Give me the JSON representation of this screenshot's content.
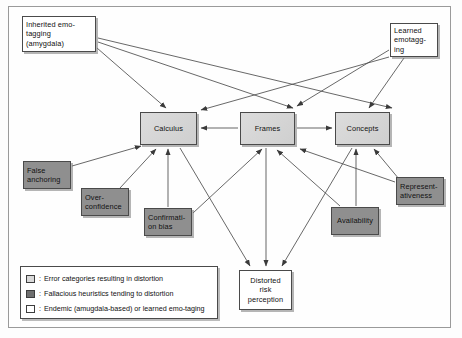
{
  "figure": {
    "colors": {
      "light_gray_fill": "#d6d6d6",
      "dark_gray_fill": "#8f8f8f",
      "white_fill": "#ffffff",
      "border": "#4a4a4a",
      "background": "#fefefe"
    }
  },
  "nodes": [
    {
      "id": "inherited",
      "label": "Inherited emo-\ntagging\n(amygdala)",
      "style": "white",
      "align": "left",
      "x": 22,
      "y": 16,
      "w": 74,
      "h": 36
    },
    {
      "id": "learned",
      "label": "Learned\nemotagg-\ning",
      "style": "white",
      "align": "left",
      "x": 390,
      "y": 23,
      "w": 48,
      "h": 34
    },
    {
      "id": "calculus",
      "label": "Calculus",
      "style": "lightgray",
      "align": "center",
      "x": 140,
      "y": 112,
      "w": 57,
      "h": 33
    },
    {
      "id": "frames",
      "label": "Frames",
      "style": "lightgray",
      "align": "center",
      "x": 240,
      "y": 112,
      "w": 55,
      "h": 33
    },
    {
      "id": "concepts",
      "label": "Concepts",
      "style": "lightgray",
      "align": "center",
      "x": 335,
      "y": 112,
      "w": 55,
      "h": 33
    },
    {
      "id": "false-anchor",
      "label": "False\nanchoring",
      "style": "darkgray",
      "align": "left",
      "x": 23,
      "y": 161,
      "w": 48,
      "h": 28
    },
    {
      "id": "overconfidence",
      "label": "Over-\nconfidence",
      "style": "darkgray",
      "align": "left",
      "x": 81,
      "y": 188,
      "w": 48,
      "h": 28
    },
    {
      "id": "confirmation",
      "label": "Confirmati-\non bias",
      "style": "darkgray",
      "align": "left",
      "x": 144,
      "y": 208,
      "w": 48,
      "h": 28
    },
    {
      "id": "availability",
      "label": "Availability",
      "style": "darkgray",
      "align": "center",
      "x": 331,
      "y": 207,
      "w": 48,
      "h": 28
    },
    {
      "id": "representative",
      "label": "Represent-\nativeness",
      "style": "darkgray",
      "align": "left",
      "x": 396,
      "y": 177,
      "w": 48,
      "h": 28
    },
    {
      "id": "distorted",
      "label": "Distorted\nrisk\nperception",
      "style": "white",
      "align": "center",
      "x": 239,
      "y": 270,
      "w": 53,
      "h": 40
    }
  ],
  "edges": [
    {
      "from": "inherited",
      "to": "calculus"
    },
    {
      "from": "inherited",
      "to": "frames"
    },
    {
      "from": "inherited",
      "to": "concepts"
    },
    {
      "from": "learned",
      "to": "calculus"
    },
    {
      "from": "learned",
      "to": "frames"
    },
    {
      "from": "learned",
      "to": "concepts"
    },
    {
      "from": "frames",
      "to": "calculus"
    },
    {
      "from": "frames",
      "to": "concepts"
    },
    {
      "from": "false-anchor",
      "to": "calculus"
    },
    {
      "from": "overconfidence",
      "to": "calculus"
    },
    {
      "from": "confirmation",
      "to": "calculus"
    },
    {
      "from": "confirmation",
      "to": "frames"
    },
    {
      "from": "availability",
      "to": "frames"
    },
    {
      "from": "availability",
      "to": "concepts"
    },
    {
      "from": "representative",
      "to": "frames"
    },
    {
      "from": "representative",
      "to": "concepts"
    },
    {
      "from": "calculus",
      "to": "distorted"
    },
    {
      "from": "frames",
      "to": "distorted"
    },
    {
      "from": "concepts",
      "to": "distorted"
    }
  ],
  "legend": {
    "rows": [
      {
        "swatch": "lightgray",
        "separator": ":",
        "text": "Error categories resulting in distortion"
      },
      {
        "swatch": "darkgray",
        "separator": ":",
        "text": "Fallacious heuristics tending to distortion"
      },
      {
        "swatch": "white",
        "separator": ":",
        "text": "Endemic (amugdala-based) or learned emo-taging"
      }
    ]
  }
}
